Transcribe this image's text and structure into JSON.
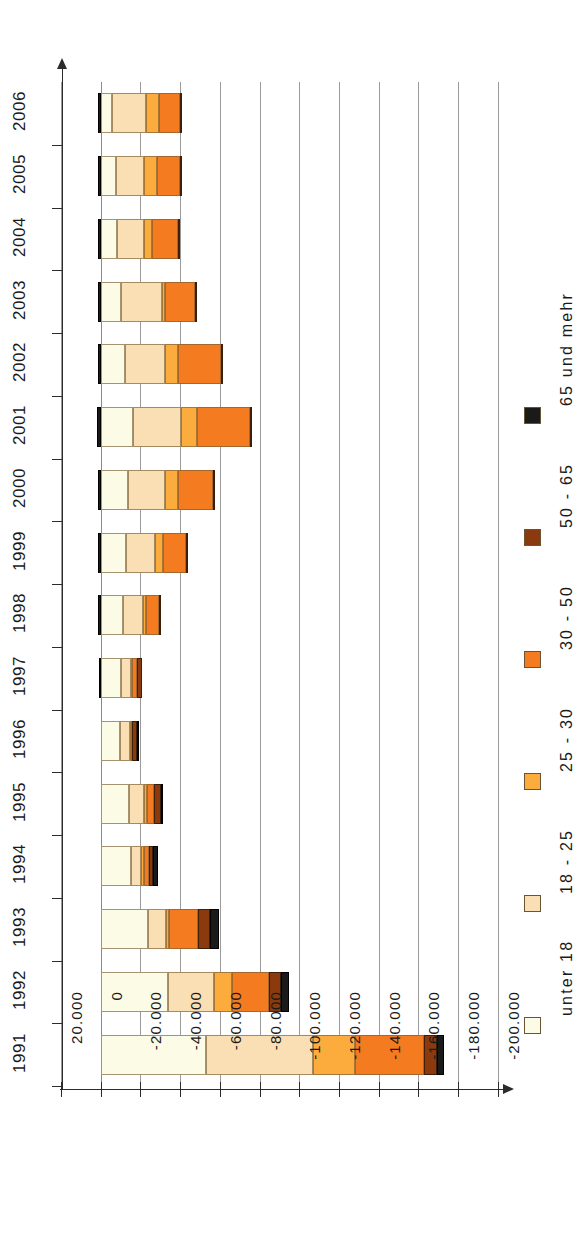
{
  "chart_data": {
    "type": "bar",
    "orientation": "horizontal",
    "stacked": true,
    "title": "",
    "subtitle": "",
    "xlabel": "",
    "ylabel": "",
    "grid": true,
    "legend_position": "right",
    "xlim": [
      20000,
      -200000
    ],
    "xticks": [
      20000,
      0,
      -20000,
      -40000,
      -60000,
      -80000,
      -100000,
      -120000,
      -140000,
      -160000,
      -180000,
      -200000
    ],
    "xtick_labels": [
      "20.000",
      "0",
      "-20.000",
      "-40.000",
      "-60.000",
      "-80.000",
      "-100.000",
      "-120.000",
      "-140.000",
      "-160.000",
      "-180.000",
      "-200.000"
    ],
    "categories": [
      "1991",
      "1992",
      "1993",
      "1994",
      "1995",
      "1996",
      "1997",
      "1998",
      "1999",
      "2000",
      "2001",
      "2002",
      "2003",
      "2004",
      "2005",
      "2006"
    ],
    "series": [
      {
        "name": "unter 18",
        "color": "#FCFBE6",
        "values": [
          -53000,
          -34000,
          -24000,
          -15500,
          -14500,
          -9500,
          -10000,
          -11000,
          -12500,
          -14000,
          -16500,
          -12000,
          -10000,
          -8000,
          -7500,
          -5500
        ]
      },
      {
        "name": "18 - 25",
        "color": "#FADFB4",
        "values": [
          -54000,
          -23000,
          -9000,
          -5000,
          -7500,
          -5500,
          -5500,
          -10500,
          -15000,
          -18500,
          -24000,
          -20500,
          -21000,
          -14000,
          -14500,
          -17500
        ]
      },
      {
        "name": "25 - 30",
        "color": "#FBAC3C",
        "values": [
          -21000,
          -9000,
          -1500,
          -1500,
          -1500,
          -500,
          -500,
          -1500,
          -4000,
          -6500,
          -8000,
          -6500,
          -1500,
          -4000,
          -6500,
          -6500
        ]
      },
      {
        "name": "30 - 50",
        "color": "#F47B20",
        "values": [
          -35000,
          -19000,
          -14500,
          -2500,
          -3500,
          -500,
          -2500,
          -6500,
          -11500,
          -17500,
          -26500,
          -21500,
          -15000,
          -13000,
          -11500,
          -10500
        ]
      },
      {
        "name": "50 - 65",
        "color": "#8B3A0E",
        "values": [
          -6500,
          -6000,
          -6000,
          -2000,
          -3500,
          -2500,
          -2500,
          -1000,
          -1000,
          -1000,
          -1000,
          -1000,
          -500,
          -500,
          -500,
          -500
        ]
      },
      {
        "name": "65 und mehr",
        "color": "#1A1A1A",
        "values": [
          -3500,
          -4000,
          -4500,
          -2500,
          -500,
          -500,
          1000,
          1500,
          1500,
          1500,
          2000,
          1500,
          1500,
          1500,
          1500,
          1500
        ]
      }
    ]
  },
  "legend": {
    "items": [
      {
        "label": "unter 18",
        "color": "#FCFBE6"
      },
      {
        "label": "18 - 25",
        "color": "#FADFB4"
      },
      {
        "label": "25 - 30",
        "color": "#FBAC3C"
      },
      {
        "label": "30 - 50",
        "color": "#F47B20"
      },
      {
        "label": "50 - 65",
        "color": "#8B3A0E"
      },
      {
        "label": "65 und mehr",
        "color": "#1A1A1A"
      }
    ]
  }
}
